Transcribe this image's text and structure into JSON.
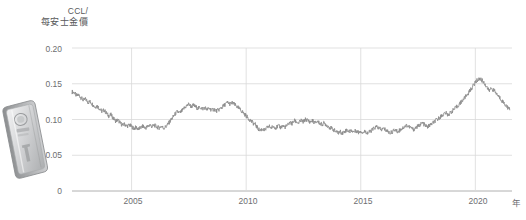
{
  "chart_data": {
    "type": "line",
    "title_line1": "CCL/",
    "title_line2": "每安士金價",
    "xlabel": "年",
    "ylabel": "CCL/每安士金價",
    "xlim": [
      2002.4,
      2021.6
    ],
    "ylim": [
      0,
      0.2
    ],
    "grid": true,
    "legend": "none",
    "line_color": "#8c8c8c",
    "grid_color": "#d9d9d9",
    "ytick_labels": [
      "0.20",
      "0.15",
      "0.10",
      "0.05",
      "0"
    ],
    "ytick_values": [
      0.2,
      0.15,
      0.1,
      0.05,
      0
    ],
    "xtick_labels": [
      "2005",
      "2010",
      "2015",
      "2020"
    ],
    "xtick_values": [
      2005,
      2010,
      2015,
      2020
    ],
    "series": [
      {
        "name": "CCL/每安士金價",
        "x": [
          2002.4,
          2002.5,
          2002.6,
          2002.7,
          2002.8,
          2002.9,
          2003.0,
          2003.1,
          2003.2,
          2003.3,
          2003.4,
          2003.5,
          2003.6,
          2003.7,
          2003.8,
          2003.9,
          2004.0,
          2004.1,
          2004.2,
          2004.3,
          2004.4,
          2004.5,
          2004.6,
          2004.7,
          2004.8,
          2004.9,
          2005.0,
          2005.1,
          2005.2,
          2005.3,
          2005.4,
          2005.5,
          2005.6,
          2005.7,
          2005.8,
          2005.9,
          2006.0,
          2006.1,
          2006.2,
          2006.3,
          2006.4,
          2006.5,
          2006.6,
          2006.7,
          2006.8,
          2006.9,
          2007.0,
          2007.1,
          2007.2,
          2007.3,
          2007.4,
          2007.5,
          2007.6,
          2007.7,
          2007.8,
          2007.9,
          2008.0,
          2008.1,
          2008.2,
          2008.3,
          2008.4,
          2008.5,
          2008.6,
          2008.7,
          2008.8,
          2008.9,
          2009.0,
          2009.1,
          2009.2,
          2009.3,
          2009.4,
          2009.5,
          2009.6,
          2009.7,
          2009.8,
          2009.9,
          2010.0,
          2010.1,
          2010.2,
          2010.3,
          2010.4,
          2010.5,
          2010.6,
          2010.7,
          2010.8,
          2010.9,
          2011.0,
          2011.1,
          2011.2,
          2011.3,
          2011.4,
          2011.5,
          2011.6,
          2011.7,
          2011.8,
          2011.9,
          2012.0,
          2012.1,
          2012.2,
          2012.3,
          2012.4,
          2012.5,
          2012.6,
          2012.7,
          2012.8,
          2012.9,
          2013.0,
          2013.1,
          2013.2,
          2013.3,
          2013.4,
          2013.5,
          2013.6,
          2013.7,
          2013.8,
          2013.9,
          2014.0,
          2014.1,
          2014.2,
          2014.3,
          2014.4,
          2014.5,
          2014.6,
          2014.7,
          2014.8,
          2014.9,
          2015.0,
          2015.1,
          2015.2,
          2015.3,
          2015.4,
          2015.5,
          2015.6,
          2015.7,
          2015.8,
          2015.9,
          2016.0,
          2016.1,
          2016.2,
          2016.3,
          2016.4,
          2016.5,
          2016.6,
          2016.7,
          2016.8,
          2016.9,
          2017.0,
          2017.1,
          2017.2,
          2017.3,
          2017.4,
          2017.5,
          2017.6,
          2017.7,
          2017.8,
          2017.9,
          2018.0,
          2018.1,
          2018.2,
          2018.3,
          2018.4,
          2018.5,
          2018.6,
          2018.7,
          2018.8,
          2018.9,
          2019.0,
          2019.1,
          2019.2,
          2019.3,
          2019.4,
          2019.5,
          2019.6,
          2019.7,
          2019.8,
          2019.9,
          2020.0,
          2020.1,
          2020.2,
          2020.3,
          2020.4,
          2020.5,
          2020.6,
          2020.7,
          2020.8,
          2020.9,
          2021.0,
          2021.1,
          2021.2,
          2021.3,
          2021.4,
          2021.5
        ],
        "y": [
          0.139,
          0.1375,
          0.133,
          0.1345,
          0.13,
          0.127,
          0.1285,
          0.124,
          0.125,
          0.121,
          0.1175,
          0.119,
          0.1155,
          0.1115,
          0.113,
          0.109,
          0.105,
          0.1065,
          0.102,
          0.098,
          0.0995,
          0.0955,
          0.092,
          0.0935,
          0.0905,
          0.0925,
          0.09,
          0.0875,
          0.089,
          0.0865,
          0.0885,
          0.0905,
          0.088,
          0.09,
          0.0925,
          0.09,
          0.092,
          0.0895,
          0.0885,
          0.0905,
          0.088,
          0.09,
          0.094,
          0.0985,
          0.103,
          0.1075,
          0.111,
          0.109,
          0.112,
          0.116,
          0.119,
          0.1215,
          0.118,
          0.12,
          0.1175,
          0.1155,
          0.117,
          0.115,
          0.1165,
          0.114,
          0.1155,
          0.113,
          0.1145,
          0.112,
          0.1135,
          0.116,
          0.1185,
          0.1215,
          0.124,
          0.1215,
          0.1235,
          0.1205,
          0.118,
          0.115,
          0.112,
          0.1085,
          0.105,
          0.1015,
          0.0985,
          0.095,
          0.093,
          0.088,
          0.0845,
          0.087,
          0.0845,
          0.088,
          0.0905,
          0.0885,
          0.0905,
          0.0885,
          0.091,
          0.089,
          0.091,
          0.0895,
          0.0915,
          0.096,
          0.094,
          0.0985,
          0.0965,
          0.095,
          0.0985,
          0.0965,
          0.1005,
          0.0985,
          0.0965,
          0.0985,
          0.095,
          0.0975,
          0.095,
          0.093,
          0.095,
          0.0925,
          0.09,
          0.088,
          0.086,
          0.0835,
          0.081,
          0.083,
          0.081,
          0.0835,
          0.0855,
          0.083,
          0.085,
          0.0825,
          0.0845,
          0.082,
          0.084,
          0.0815,
          0.0835,
          0.081,
          0.083,
          0.0855,
          0.088,
          0.09,
          0.0875,
          0.0855,
          0.0875,
          0.085,
          0.083,
          0.081,
          0.0835,
          0.0855,
          0.083,
          0.085,
          0.0875,
          0.0895,
          0.092,
          0.09,
          0.088,
          0.086,
          0.0885,
          0.0905,
          0.093,
          0.095,
          0.092,
          0.0895,
          0.0915,
          0.094,
          0.0965,
          0.099,
          0.1015,
          0.1045,
          0.107,
          0.1095,
          0.1065,
          0.109,
          0.112,
          0.115,
          0.118,
          0.1215,
          0.125,
          0.129,
          0.133,
          0.137,
          0.142,
          0.147,
          0.152,
          0.1555,
          0.157,
          0.1545,
          0.1505,
          0.1455,
          0.14,
          0.144,
          0.141,
          0.137,
          0.133,
          0.129,
          0.125,
          0.121,
          0.1175,
          0.1135
        ]
      }
    ],
    "annotations": [],
    "icon": "gold-ingot-bar"
  }
}
